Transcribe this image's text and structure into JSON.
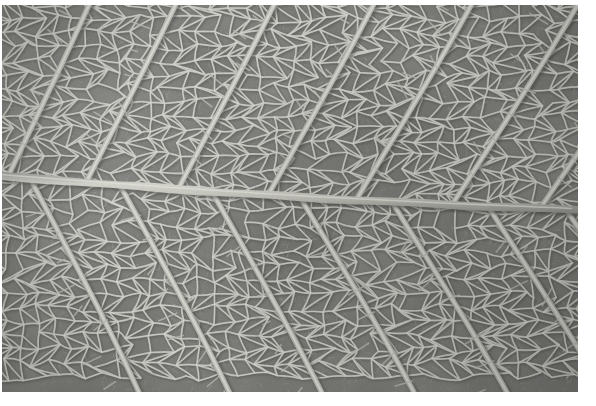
{
  "image": {
    "kind": "macro-photograph",
    "subject": "leaf-venation",
    "treatment": "black-and-white",
    "alt_text": "Black and white macro photograph of the underside of a leaf showing a horizontal midrib with secondary veins branching diagonally and a dense polygonal network of tertiary veins",
    "frame": {
      "canvas_width": 596,
      "canvas_height": 406,
      "photo_left": 2,
      "photo_top": 5,
      "photo_width": 576,
      "photo_height": 387,
      "matte_color": "#ffffff"
    },
    "palette": {
      "lamina_dark": "#636460",
      "lamina_mid": "#74756f",
      "lamina_light": "#84857e",
      "vein_bright": "#d8d8d2",
      "vein_mid": "#b9b9b2",
      "vein_faint": "#9b9b94",
      "midrib": "#c3c3bb",
      "shadow": "#4a4b47",
      "matte": "#ffffff"
    },
    "structure": {
      "midrib_label": "midrib",
      "midrib_left_y": 176,
      "midrib_right_y": 210,
      "midrib_width_px": 8,
      "secondary_vein_count": 9,
      "secondary_vein_width_px": 4,
      "tertiary_mesh_cell_size_px": 16,
      "upper_branch_angle_deg": -52,
      "lower_branch_angle_deg": 52
    },
    "veins_upper": [
      {
        "name": "secondary-upper-1",
        "origin_x": 8,
        "angle": -58
      },
      {
        "name": "secondary-upper-2",
        "origin_x": 86,
        "angle": -56
      },
      {
        "name": "secondary-upper-3",
        "origin_x": 178,
        "angle": -55
      },
      {
        "name": "secondary-upper-4",
        "origin_x": 268,
        "angle": -53
      },
      {
        "name": "secondary-upper-5",
        "origin_x": 356,
        "angle": -51
      },
      {
        "name": "secondary-upper-6",
        "origin_x": 452,
        "angle": -49
      },
      {
        "name": "secondary-upper-7",
        "origin_x": 540,
        "angle": -47
      }
    ],
    "veins_lower": [
      {
        "name": "secondary-lower-1",
        "origin_x": 30,
        "angle": 56
      },
      {
        "name": "secondary-lower-2",
        "origin_x": 120,
        "angle": 55
      },
      {
        "name": "secondary-lower-3",
        "origin_x": 212,
        "angle": 54
      },
      {
        "name": "secondary-lower-4",
        "origin_x": 300,
        "angle": 52
      },
      {
        "name": "secondary-lower-5",
        "origin_x": 392,
        "angle": 51
      },
      {
        "name": "secondary-lower-6",
        "origin_x": 488,
        "angle": 50
      },
      {
        "name": "secondary-lower-7",
        "origin_x": 566,
        "angle": 48
      }
    ]
  }
}
